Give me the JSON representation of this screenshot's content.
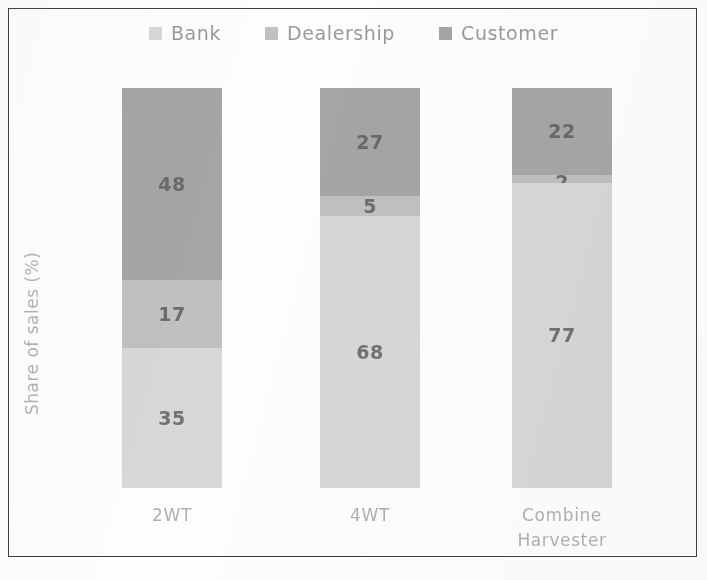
{
  "chart_data": {
    "type": "bar",
    "variant": "stacked-vertical-100",
    "title": "",
    "xlabel": "",
    "ylabel": "Share of sales (%)",
    "ylim": [
      0,
      100
    ],
    "grid": false,
    "legend_position": "top-center",
    "categories": [
      "2WT",
      "4WT",
      "Combine Harvester"
    ],
    "category_label_lines": [
      [
        "2WT"
      ],
      [
        "4WT"
      ],
      [
        "Combine",
        "Harvester"
      ]
    ],
    "series": [
      {
        "name": "Bank",
        "color": "#d7d7d7",
        "values": [
          35,
          68,
          77
        ],
        "labels": [
          "35",
          "68",
          "77"
        ]
      },
      {
        "name": "Dealership",
        "color": "#c0c0c0",
        "values": [
          17,
          5,
          2
        ],
        "labels": [
          "17",
          "5",
          "2"
        ]
      },
      {
        "name": "Customer",
        "color": "#a5a5a5",
        "values": [
          48,
          27,
          22
        ],
        "labels": [
          "48",
          "27",
          "22"
        ]
      }
    ],
    "stack_order_bottom_to_top": [
      "Bank",
      "Dealership",
      "Customer"
    ],
    "annotations": []
  },
  "legend": {
    "items": [
      {
        "label": "Bank",
        "color": "#d7d7d7"
      },
      {
        "label": "Dealership",
        "color": "#c0c0c0"
      },
      {
        "label": "Customer",
        "color": "#a5a5a5"
      }
    ]
  },
  "axis": {
    "y_title": "Share of sales (%)"
  },
  "style": {
    "border_color": "#3f3f3f",
    "label_text_color": "#5c5c5c",
    "axis_text_color": "#b0b0b0",
    "legend_text_color": "#9a9a9a",
    "background": "#fdfdfd"
  }
}
